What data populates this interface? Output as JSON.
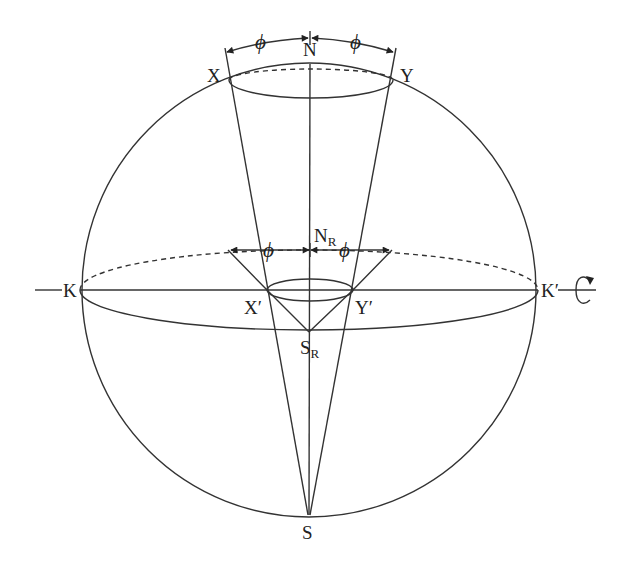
{
  "diagram": {
    "type": "sphere-projection-geometry",
    "labels": {
      "N": "N",
      "S": "S",
      "X": "X",
      "Y": "Y",
      "K": "K",
      "K_prime": "K′",
      "X_prime": "X′",
      "Y_prime": "Y′",
      "N_R_main": "N",
      "N_R_sub": "R",
      "S_R_main": "S",
      "S_R_sub": "R",
      "phi_upper_left": "ϕ",
      "phi_upper_right": "ϕ",
      "phi_lower_left": "ϕ",
      "phi_lower_right": "ϕ"
    },
    "icons": {
      "rotation": "rotation-arrow-icon"
    },
    "colors": {
      "stroke": "#333333",
      "text": "#222222",
      "background": "#ffffff"
    }
  }
}
